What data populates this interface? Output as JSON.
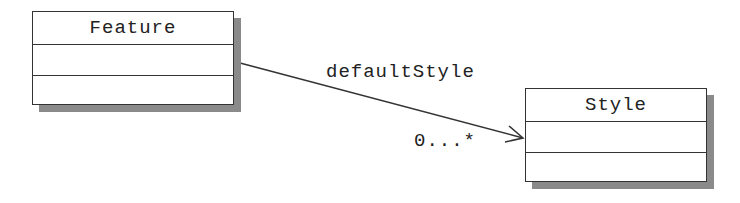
{
  "diagram": {
    "type": "uml-class",
    "classes": [
      {
        "name": "Feature",
        "attributes": [],
        "operations": []
      },
      {
        "name": "Style",
        "attributes": [],
        "operations": []
      }
    ],
    "association": {
      "from": "Feature",
      "to": "Style",
      "role": "defaultStyle",
      "multiplicity": "0...*",
      "navigable_to": "Style"
    }
  },
  "colors": {
    "line": "#333333",
    "shadow": "#8a8a8a",
    "fill": "#ffffff"
  }
}
